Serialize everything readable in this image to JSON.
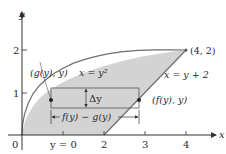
{
  "figure": {
    "axes": {
      "x_label": "x",
      "y_label": "y",
      "origin_label": "0",
      "x_ticks": [
        {
          "value": 2,
          "label": "2"
        },
        {
          "value": 3,
          "label": "3"
        },
        {
          "value": 4,
          "label": "4"
        }
      ],
      "x_extra_tick_label": "y = 0",
      "y_ticks": [
        {
          "value": 1,
          "label": "1"
        },
        {
          "value": 2,
          "label": "2"
        }
      ]
    },
    "curves": {
      "parabola_label": "x = y²",
      "line_label": "x = y + 2"
    },
    "points": {
      "intersection_label": "(4, 2)",
      "left_point_label": "(g(y), y)",
      "right_point_label": "(f(y), y)"
    },
    "strip": {
      "height_label": "Δy",
      "width_label": "f(y) − g(y)"
    },
    "colors": {
      "region_fill": "#d3d3d3",
      "curve_stroke": "#6e6e6e",
      "axis": "#333333",
      "text": "#2a2a2a"
    }
  }
}
